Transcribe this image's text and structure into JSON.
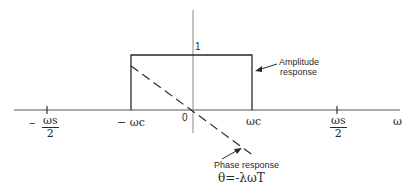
{
  "diagram": {
    "axes": {
      "x_label": "ω",
      "origin_label": "0",
      "amplitude_level_label": "1"
    },
    "ticks": {
      "neg_ws_half": {
        "sign": "−",
        "num": "ωs",
        "den": "2"
      },
      "neg_wc": "− ωc",
      "wc": "ωc",
      "pos_ws_half": {
        "num": "ωs",
        "den": "2"
      }
    },
    "annotations": {
      "amplitude_line1": "Amplitude",
      "amplitude_line2": "response",
      "phase_line1": "Phase response",
      "phase_formula": "θ=-λωT"
    },
    "colors": {
      "ink": "#2a2a2a",
      "axis": "#8a8a8a",
      "background": "#ffffff"
    }
  }
}
